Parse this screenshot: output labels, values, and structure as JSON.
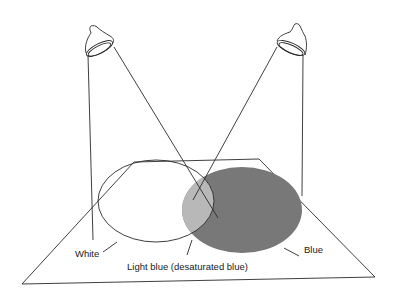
{
  "diagram": {
    "type": "additive color mixing illustration",
    "lamps": [
      {
        "name": "left spotlight",
        "light": "white"
      },
      {
        "name": "right spotlight",
        "light": "blue"
      }
    ],
    "regions": [
      {
        "name": "white",
        "label": "White",
        "fill": "#ffffff"
      },
      {
        "name": "light-blue",
        "label": "Light blue (desaturated blue)",
        "fill": "#b5b5b5"
      },
      {
        "name": "blue",
        "label": "Blue",
        "fill": "#787878"
      }
    ],
    "colors": {
      "line": "#2a2a2a",
      "background": "#ffffff"
    }
  },
  "labels": {
    "white": "White",
    "light_blue": "Light blue (desaturated blue)",
    "blue": "Blue"
  }
}
